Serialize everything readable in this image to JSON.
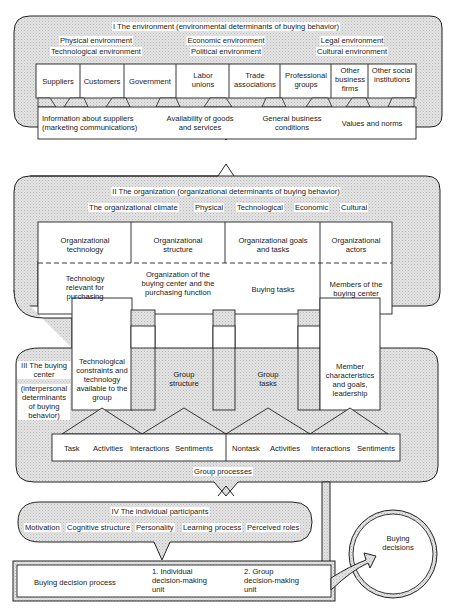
{
  "environment": {
    "title": "I The environment (environmental determinants of buying behavior)",
    "categories": {
      "col1": [
        "Physical environment",
        "Technological environment"
      ],
      "col2": [
        "Economic environment",
        "Political environment"
      ],
      "col3": [
        "Legal environment",
        "Cultural environment"
      ]
    },
    "actors": [
      "Suppliers",
      "Customers",
      "Government",
      "Labor unions",
      "Trade associations",
      "Professional groups",
      "Other business firms",
      "Other social institutions"
    ],
    "influences": [
      "Information about suppliers (marketing communications)",
      "Availability of goods and services",
      "General business conditions",
      "Values and norms"
    ]
  },
  "organization": {
    "title": "II The organization (organizational determinants of buying behavior)",
    "climate_label": "The organizational climate",
    "climate_items": [
      "Physical",
      "Technological",
      "Economic",
      "Cultural"
    ],
    "columns": [
      {
        "header": "Organizational technology",
        "sub": "Technology relevant for purchasing"
      },
      {
        "header": "Organizational structure",
        "sub": "Organization of the buying center and the purchasing function"
      },
      {
        "header": "Organizational goals and tasks",
        "sub": "Buying tasks"
      },
      {
        "header": "Organizational actors",
        "sub": "Members of the buying center"
      }
    ]
  },
  "buying_center": {
    "title": "III The buying center",
    "subtitle": "(interpersonal determinants of buying behavior)",
    "group_factors": [
      "Technological constraints and technology available to the group",
      "Group structure",
      "Group tasks",
      "Member characteristics and goals, leadership"
    ],
    "task_row": [
      "Task",
      "Activities",
      "Interactions",
      "Sentiments"
    ],
    "nontask_row": [
      "Nontask",
      "Activities",
      "Interactions",
      "Sentiments"
    ],
    "group_processes_label": "Group processes"
  },
  "individual": {
    "title": "IV The individual participants",
    "factors": [
      "Motivation",
      "Cognitive structure",
      "Personality",
      "Learning process",
      "Perceived roles"
    ]
  },
  "decision_process": {
    "label": "Buying decision process",
    "unit1": "1. Individual decision-making unit",
    "unit2": "2. Group decision-making unit"
  },
  "outcome": {
    "label": "Buying decisions"
  }
}
